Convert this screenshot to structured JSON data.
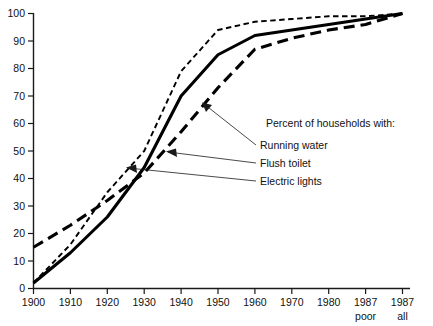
{
  "chart_data": {
    "type": "line",
    "title": "",
    "subtitle": "",
    "xlabel": "",
    "ylabel": "",
    "ylim": [
      0,
      100
    ],
    "ytick_labels": [
      "0",
      "10",
      "20",
      "30",
      "40",
      "50",
      "60",
      "70",
      "80",
      "90",
      "100"
    ],
    "ytick_values": [
      0,
      10,
      20,
      30,
      40,
      50,
      60,
      70,
      80,
      90,
      100
    ],
    "categories": [
      "1900",
      "1910",
      "1920",
      "1930",
      "1940",
      "1950",
      "1960",
      "1970",
      "1980",
      "1987",
      "1987"
    ],
    "category_sublabels": [
      "",
      "",
      "",
      "",
      "",
      "",
      "",
      "",
      "",
      "poor",
      "all"
    ],
    "grid": false,
    "legend_position": "inside-right",
    "legend_title": "Percent of households with:",
    "series": [
      {
        "name": "Running water",
        "style": "long-dash",
        "values": [
          15,
          23,
          32,
          42,
          57,
          73,
          87,
          91,
          94,
          96,
          100
        ]
      },
      {
        "name": "Flush toilet",
        "style": "solid",
        "values": [
          2,
          13,
          26,
          44,
          70,
          85,
          92,
          94,
          96,
          98,
          100
        ]
      },
      {
        "name": "Electric lights",
        "style": "short-dash",
        "values": [
          2,
          16,
          35,
          50,
          79,
          94,
          97,
          98,
          99,
          99,
          100
        ]
      }
    ],
    "annotations": [
      {
        "text": "Percent of households with:",
        "role": "legend-title"
      },
      {
        "text": "Running water",
        "role": "series-label"
      },
      {
        "text": "Flush toilet",
        "role": "series-label"
      },
      {
        "text": "Electric lights",
        "role": "series-label"
      }
    ]
  },
  "legend": {
    "title": "Percent of households with:",
    "items": [
      {
        "label": "Running water"
      },
      {
        "label": "Flush toilet"
      },
      {
        "label": "Electric lights"
      }
    ]
  },
  "yaxis": {
    "t0": "0",
    "t10": "10",
    "t20": "20",
    "t30": "30",
    "t40": "40",
    "t50": "50",
    "t60": "60",
    "t70": "70",
    "t80": "80",
    "t90": "90",
    "t100": "100"
  },
  "xaxis": {
    "t1900": "1900",
    "t1910": "1910",
    "t1920": "1920",
    "t1930": "1930",
    "t1940": "1940",
    "t1950": "1950",
    "t1960": "1960",
    "t1970": "1970",
    "t1980": "1980",
    "t1987poor": "1987",
    "t1987poor_sub": "poor",
    "t1987all": "1987",
    "t1987all_sub": "all"
  },
  "colors": {
    "ink": "#000000",
    "background": "#ffffff"
  }
}
